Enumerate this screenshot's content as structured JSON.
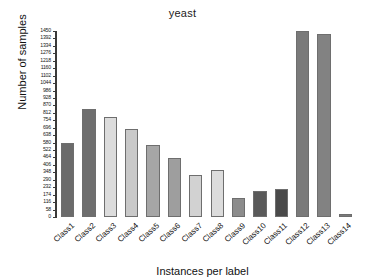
{
  "chart_data": {
    "type": "bar",
    "title": "yeast",
    "xlabel": "Instances per label",
    "ylabel": "Number of samples",
    "categories": [
      "Class1",
      "Class2",
      "Class3",
      "Class4",
      "Class5",
      "Class6",
      "Class7",
      "Class8",
      "Class9",
      "Class10",
      "Class11",
      "Class12",
      "Class13",
      "Class14"
    ],
    "values": [
      580,
      840,
      780,
      690,
      560,
      460,
      330,
      365,
      150,
      200,
      220,
      1450,
      1430,
      25
    ],
    "bar_colors": [
      "#6b6b6b",
      "#6e6e6e",
      "#dcdcdc",
      "#c9c9c9",
      "#a6a6a6",
      "#9e9e9e",
      "#d2d2d2",
      "#dcdcdc",
      "#8c8c8c",
      "#5a5a5a",
      "#4a4a4a",
      "#7a7a7a",
      "#828282",
      "#7a7a7a"
    ],
    "ylim": [
      0,
      1450
    ],
    "ytick_step": 58,
    "yticks": [
      0,
      58,
      116,
      174,
      232,
      290,
      348,
      406,
      464,
      522,
      580,
      638,
      696,
      754,
      812,
      870,
      928,
      986,
      1044,
      1102,
      1160,
      1218,
      1276,
      1334,
      1392,
      1450
    ],
    "grid": false,
    "legend": "none"
  }
}
